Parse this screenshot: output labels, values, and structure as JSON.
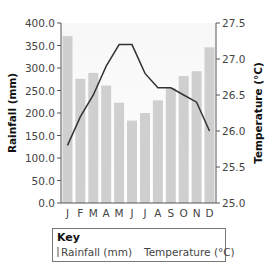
{
  "chart_data": {
    "type": "bar+line",
    "title": "",
    "categories": [
      "J",
      "F",
      "M",
      "A",
      "M",
      "J",
      "J",
      "A",
      "S",
      "O",
      "N",
      "D"
    ],
    "series": [
      {
        "name": "Rainfall (mm)",
        "type": "bar",
        "axis": "left",
        "color": "#cfcfcf",
        "values": [
          371,
          276,
          289,
          261,
          223,
          183,
          200,
          228,
          256,
          282,
          293,
          346
        ]
      },
      {
        "name": "Temperature (°C)",
        "type": "line",
        "axis": "right",
        "color": "#333333",
        "values": [
          25.8,
          26.2,
          26.5,
          26.9,
          27.2,
          27.2,
          26.8,
          26.6,
          26.6,
          26.5,
          26.4,
          26.0
        ]
      }
    ],
    "ylabel": "Rainfall (mm)",
    "ylim": [
      0,
      400
    ],
    "yticks": [
      "0.0",
      "50.0",
      "100.0",
      "150.0",
      "200.0",
      "250.0",
      "300.0",
      "350.0",
      "400.0"
    ],
    "y2label": "Temperature (°C)",
    "y2lim": [
      25.0,
      27.5
    ],
    "y2ticks": [
      "25.0",
      "25.5",
      "26.0",
      "26.5",
      "27.0",
      "27.5"
    ],
    "xlabel": "",
    "grid": false,
    "legend_position": "bottom"
  },
  "legend": {
    "title": "Key",
    "rainfall_label": "Rainfall (mm)",
    "temperature_label": "Temperature (°C)"
  }
}
